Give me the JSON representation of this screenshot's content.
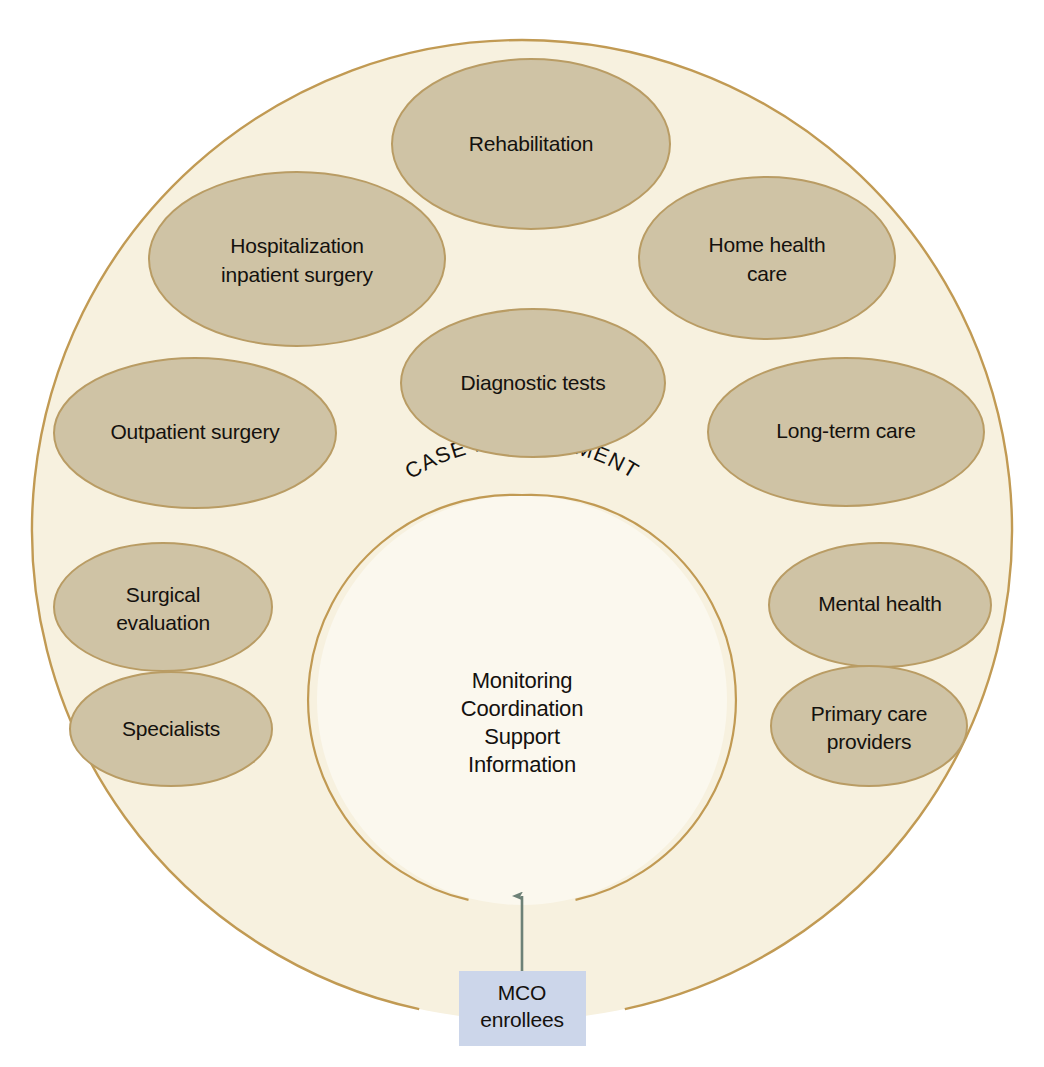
{
  "diagram": {
    "type": "concentric-circle-node-diagram",
    "title_arc": "CASE MANAGEMENT",
    "colors": {
      "page_background": "#ffffff",
      "outer_circle_fill": "#f7f1df",
      "outer_circle_stroke": "#c19a53",
      "inner_circle_fill": "#fbf8ee",
      "inner_circle_stroke": "#c19a53",
      "ellipse_fill": "#cfc3a5",
      "ellipse_stroke": "#b99c64",
      "text": "#14110e",
      "box_fill": "#ccd6ea",
      "arrow": "#6d8177"
    },
    "center": {
      "lines": [
        "Monitoring",
        "Coordination",
        "Support",
        "Information"
      ]
    },
    "services": [
      {
        "id": "rehabilitation",
        "lines": [
          "Rehabilitation"
        ]
      },
      {
        "id": "hospitalization-inpatient-surgery",
        "lines": [
          "Hospitalization",
          "inpatient surgery"
        ]
      },
      {
        "id": "home-health-care",
        "lines": [
          "Home health",
          "care"
        ]
      },
      {
        "id": "diagnostic-tests",
        "lines": [
          "Diagnostic tests"
        ]
      },
      {
        "id": "outpatient-surgery",
        "lines": [
          "Outpatient surgery"
        ]
      },
      {
        "id": "long-term-care",
        "lines": [
          "Long-term care"
        ]
      },
      {
        "id": "surgical-evaluation",
        "lines": [
          "Surgical",
          "evaluation"
        ]
      },
      {
        "id": "mental-health",
        "lines": [
          "Mental health"
        ]
      },
      {
        "id": "specialists",
        "lines": [
          "Specialists"
        ]
      },
      {
        "id": "primary-care-providers",
        "lines": [
          "Primary care",
          "providers"
        ]
      }
    ],
    "entry": {
      "box_lines": [
        "MCO",
        "enrollees"
      ],
      "arrow_direction": "up"
    }
  }
}
